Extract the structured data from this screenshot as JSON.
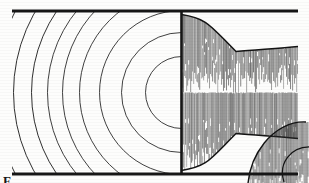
{
  "figure": {
    "kind": "scanned-line-diagram",
    "caption_partial": "F",
    "background_color": "#fdfdfc",
    "ink_color": "#1a1a1a",
    "hatch_color": "#2a2a2a",
    "width": 309,
    "height": 183
  },
  "walls": {
    "top_rail": {
      "label": "upper duct wall",
      "x1": 12,
      "x2": 298,
      "y": 11,
      "thickness": 3.2
    },
    "bottom_rail": {
      "label": "lower duct wall",
      "x1": 12,
      "x2": 298,
      "y": 174,
      "thickness": 3.2
    },
    "throat_divider": {
      "label": "throat plane",
      "x": 181.5,
      "y1": 11,
      "y2": 174,
      "thickness": 2.6
    }
  },
  "wavefronts": {
    "label": "concentric spherical wavefronts",
    "center_x": 181.5,
    "center_y": 92.5,
    "count": 9,
    "radii": [
      36,
      60,
      82,
      102,
      119,
      134,
      150,
      168,
      186
    ],
    "stroke_width": 0.85
  },
  "horn": {
    "label": "exponential horn flare, vertically hatched",
    "throat_x": 181.5,
    "throat_half_height": 78,
    "waist_x": 236,
    "waist_half_height": 41,
    "mouth_x": 298,
    "mouth_half_height": 46,
    "hatch_line_count": 120,
    "hatch_spacing": 1.0
  },
  "inner_lobe": {
    "label": "inner crescent reflection lobe, lower right",
    "cx": 292,
    "cy": 160,
    "rx": 44,
    "ry": 40
  },
  "colors": {
    "ink": "#1a1a1a",
    "hatch": "#303030",
    "paper": "#fdfdfc",
    "faint": "#555555"
  }
}
